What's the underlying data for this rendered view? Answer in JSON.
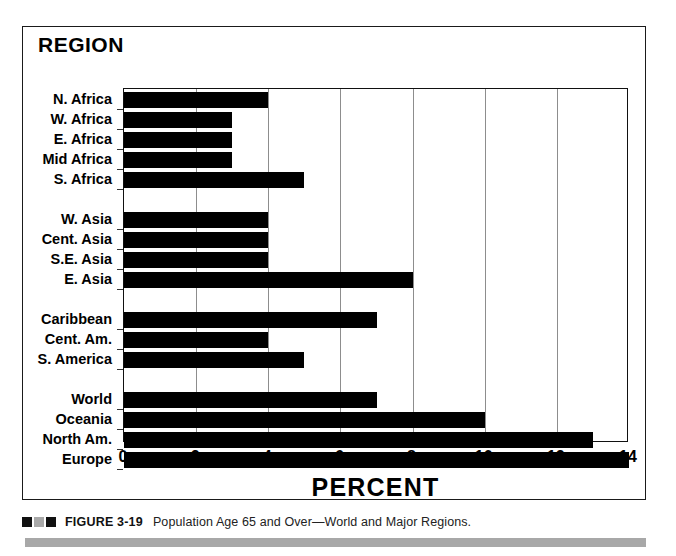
{
  "figure": {
    "chart_title": "REGION",
    "x_axis_title": "PERCENT",
    "caption_figure_number": "FIGURE 3-19",
    "caption_text": "Population Age 65 and Over—World and Major Regions.",
    "caption_marker_colors": [
      "#111111",
      "#a9a9a9",
      "#111111"
    ],
    "accent_bar_color": "#a8a8a8",
    "bar_color": "#000000",
    "gridline_color": "#8d8d8d"
  },
  "chart_data": {
    "type": "bar",
    "orientation": "horizontal",
    "title": "REGION",
    "xlabel": "PERCENT",
    "ylabel": "REGION",
    "xlim": [
      0,
      14
    ],
    "xticks": [
      0,
      2,
      4,
      6,
      8,
      10,
      12,
      14
    ],
    "xtick_labels": [
      "0",
      "2",
      "4",
      "6",
      "8",
      "10",
      "12",
      "14"
    ],
    "grid": true,
    "grid_axis": "x",
    "legend": false,
    "categories": [
      "N. Africa",
      "W. Africa",
      "E. Africa",
      "Mid Africa",
      "S. Africa",
      "W. Asia",
      "Cent. Asia",
      "S.E. Asia",
      "E. Asia",
      "Caribbean",
      "Cent. Am.",
      "S. America",
      "World",
      "Oceania",
      "North Am.",
      "Europe"
    ],
    "values": [
      4,
      3,
      3,
      3,
      5,
      4,
      4,
      4,
      8,
      7,
      4,
      5,
      7,
      10,
      13,
      14
    ],
    "groups": [
      {
        "name": "Africa",
        "categories": [
          "N. Africa",
          "W. Africa",
          "E. Africa",
          "Mid Africa",
          "S. Africa"
        ],
        "values": [
          4,
          3,
          3,
          3,
          5
        ]
      },
      {
        "name": "Asia",
        "categories": [
          "W. Asia",
          "Cent. Asia",
          "S.E. Asia",
          "E. Asia"
        ],
        "values": [
          4,
          4,
          4,
          8
        ]
      },
      {
        "name": "Americas",
        "categories": [
          "Caribbean",
          "Cent. Am.",
          "S. America"
        ],
        "values": [
          7,
          4,
          5
        ]
      },
      {
        "name": "Summary",
        "categories": [
          "World",
          "Oceania",
          "North Am.",
          "Europe"
        ],
        "values": [
          7,
          10,
          13,
          14
        ]
      }
    ]
  }
}
